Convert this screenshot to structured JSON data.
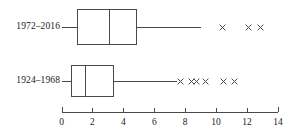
{
  "chart_data": {
    "type": "box",
    "title": "",
    "xlabel": "",
    "ylabel": "",
    "xlim": [
      0,
      14
    ],
    "grid": false,
    "legend": false,
    "x_ticks": [
      0,
      2,
      4,
      6,
      8,
      10,
      12,
      14
    ],
    "x_tick_labels": [
      "0",
      "2",
      "4",
      "6",
      "8",
      "10",
      "12",
      "14"
    ],
    "categories": [
      "1972–2016",
      "1924–1968"
    ],
    "series": [
      {
        "name": "1972–2016",
        "whisker_low": 1.0,
        "q1": 1.0,
        "median": 3.1,
        "q3": 4.9,
        "whisker_high": 9.0,
        "outliers": [
          10.4,
          12.1,
          12.9
        ]
      },
      {
        "name": "1924–1968",
        "whisker_low": 0.6,
        "q1": 0.6,
        "median": 1.55,
        "q3": 3.4,
        "whisker_high": 7.5,
        "outliers": [
          7.7,
          8.4,
          8.7,
          9.3,
          10.5,
          11.2
        ]
      }
    ],
    "marker": "x-marker",
    "axis_color": "#4a4a4a"
  },
  "labels": {
    "row1": "1972–2016",
    "row2": "1924–1968"
  }
}
